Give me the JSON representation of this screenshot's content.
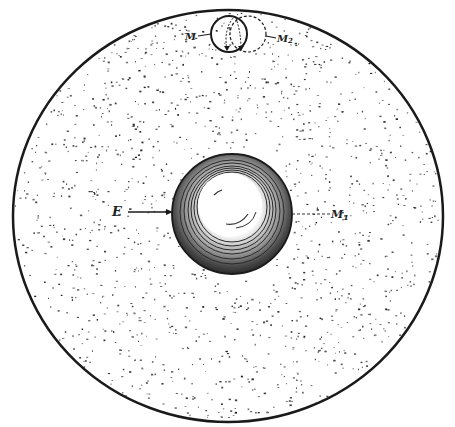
{
  "figure": {
    "colors": {
      "ink": "#1a1a1a",
      "paper": "#ffffff",
      "stipple": "#3a3a3a"
    }
  },
  "labels": {
    "earth": "E",
    "moon_center": "M",
    "moon_1": "M",
    "moon_2": "M",
    "moon_1_sub": "1",
    "moon_2_sub": "2"
  },
  "elements": {
    "outer_circle": {
      "cx": 228,
      "cy": 216,
      "rx": 215,
      "ry": 206
    },
    "central_sphere": {
      "cx": 232,
      "cy": 214,
      "r": 59
    },
    "moon_solid": {
      "cx": 229,
      "cy": 34,
      "r": 18
    },
    "moon_dashed": {
      "cx": 248,
      "cy": 34,
      "r": 18
    }
  }
}
